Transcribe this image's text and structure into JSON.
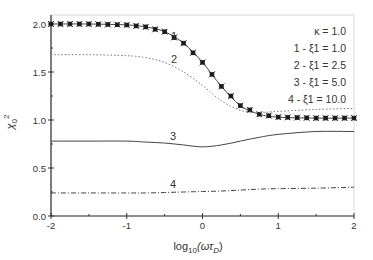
{
  "chart_data": {
    "type": "line",
    "title": "",
    "xlabel": "log10(ωτD)",
    "ylabel": "χ0²",
    "xlim": [
      -2,
      2
    ],
    "ylim": [
      0.0,
      2.1
    ],
    "xticks": [
      "-2",
      "-1",
      "0",
      "1",
      "2"
    ],
    "yticks": [
      "0.0",
      "0.5",
      "1.0",
      "1.5",
      "2.0"
    ],
    "grid": false,
    "legend_position": "upper right (text block)",
    "annotations": [
      "κ = 1.0",
      "1 - ξ1 = 1.0",
      "2 - ξ1 = 2.5",
      "3 - ξ1 = 5.0",
      "4 - ξ1 = 10.0"
    ],
    "x": [
      -2.0,
      -1.5,
      -1.0,
      -0.75,
      -0.5,
      -0.25,
      0.0,
      0.25,
      0.5,
      0.75,
      1.0,
      1.5,
      2.0
    ],
    "series": [
      {
        "name": "1",
        "label": "ξ1 = 1.0",
        "style": "line+star markers",
        "values": [
          2.0,
          2.0,
          1.99,
          1.97,
          1.92,
          1.8,
          1.6,
          1.35,
          1.15,
          1.06,
          1.03,
          1.02,
          1.02
        ]
      },
      {
        "name": "2",
        "label": "ξ1 = 2.5",
        "style": "dotted",
        "values": [
          1.68,
          1.68,
          1.67,
          1.65,
          1.6,
          1.5,
          1.36,
          1.2,
          1.1,
          1.08,
          1.09,
          1.11,
          1.12
        ]
      },
      {
        "name": "3",
        "label": "ξ1 = 5.0",
        "style": "solid",
        "values": [
          0.78,
          0.78,
          0.78,
          0.77,
          0.76,
          0.74,
          0.72,
          0.74,
          0.78,
          0.82,
          0.85,
          0.88,
          0.88
        ]
      },
      {
        "name": "4",
        "label": "ξ1 = 10.0",
        "style": "dash-dot",
        "values": [
          0.24,
          0.24,
          0.24,
          0.24,
          0.245,
          0.25,
          0.255,
          0.26,
          0.27,
          0.28,
          0.285,
          0.29,
          0.3
        ]
      }
    ]
  },
  "legend": {
    "kappa": "κ = 1.0",
    "entries": [
      "1 - ξ1 = 1.0",
      "2 - ξ1 = 2.5",
      "3 - ξ1 = 5.0",
      "4 - ξ1 = 10.0"
    ]
  },
  "curve_labels": [
    "1",
    "2",
    "3",
    "4"
  ]
}
